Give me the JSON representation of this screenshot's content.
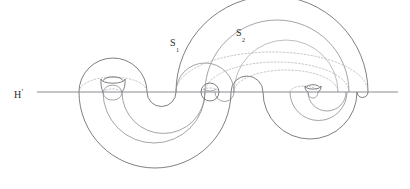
{
  "figure": {
    "kind": "mathematical-diagram",
    "background_color": "#ffffff",
    "stroke_color": "#55555a",
    "stroke_color_light": "#8a8a90",
    "plane_color": "#8c8c92",
    "hidden_stroke_color": "#a8a8ae",
    "label_color": "#2b2b2b"
  },
  "labels": {
    "plane": {
      "base": "H",
      "prime": "'"
    },
    "surface_1": {
      "base": "S",
      "sub": "1"
    },
    "surface_2": {
      "base": "S",
      "sub": "2"
    }
  },
  "geometry": {
    "plane_line": {
      "x1": 37,
      "x2": 398,
      "y": 92
    },
    "plane_crossings": [
      79,
      103,
      122,
      147,
      176,
      205,
      215,
      234,
      263,
      290,
      308,
      318,
      337,
      366
    ],
    "handles": [
      {
        "name": "left-handle",
        "cx": 113,
        "cy": 80,
        "rx": 12,
        "ry": 4
      },
      {
        "name": "middle-handle",
        "cx": 210,
        "cy": 92,
        "r": 9
      },
      {
        "name": "right-handle",
        "cx": 313,
        "cy": 92,
        "rx": 8,
        "ry": 8
      }
    ],
    "lobes": [
      {
        "name": "upper-left-dome",
        "cx": 113,
        "cy": 92,
        "r": 34
      },
      {
        "name": "upper-right-dome",
        "cx": 271,
        "cy": 92,
        "r": 96
      },
      {
        "name": "lower-left-bowl",
        "cx": 155,
        "cy": 92,
        "r": 76
      },
      {
        "name": "lower-right-bowl",
        "cx": 313,
        "cy": 92,
        "r": 47
      }
    ]
  }
}
